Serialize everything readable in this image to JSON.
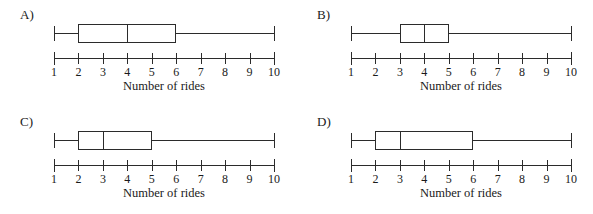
{
  "figure": {
    "background_color": "#ffffff",
    "ink_color": "#2b2b2b"
  },
  "axis": {
    "caption": "Number of rides",
    "tick_labels": [
      "1",
      "2",
      "3",
      "4",
      "5",
      "6",
      "7",
      "8",
      "9",
      "10"
    ],
    "min": 1,
    "max": 10
  },
  "panels": [
    {
      "letter": "A)",
      "name": "option-a",
      "whisker_min": 1,
      "q1": 2,
      "median": 4,
      "q3": 6,
      "whisker_max": 10
    },
    {
      "letter": "B)",
      "name": "option-b",
      "whisker_min": 1,
      "q1": 3,
      "median": 4,
      "q3": 5,
      "whisker_max": 10
    },
    {
      "letter": "C)",
      "name": "option-c",
      "whisker_min": 1,
      "q1": 2,
      "median": 3,
      "q3": 5,
      "whisker_max": 10
    },
    {
      "letter": "D)",
      "name": "option-d",
      "whisker_min": 1,
      "q1": 2,
      "median": 3,
      "q3": 6,
      "whisker_max": 10
    }
  ],
  "chart_data": {
    "type": "box",
    "title": "",
    "xlabel": "Number of rides",
    "ylabel": "",
    "xlim": [
      1,
      10
    ],
    "xticks": [
      1,
      2,
      3,
      4,
      5,
      6,
      7,
      8,
      9,
      10
    ],
    "grid": false,
    "legend": "none",
    "orientation": "horizontal",
    "panel_layout": "2x2",
    "series": [
      {
        "name": "A)",
        "whisker_min": 1,
        "q1": 2,
        "median": 4,
        "q3": 6,
        "whisker_max": 10
      },
      {
        "name": "B)",
        "whisker_min": 1,
        "q1": 3,
        "median": 4,
        "q3": 5,
        "whisker_max": 10
      },
      {
        "name": "C)",
        "whisker_min": 1,
        "q1": 2,
        "median": 3,
        "q3": 5,
        "whisker_max": 10
      },
      {
        "name": "D)",
        "whisker_min": 1,
        "q1": 2,
        "median": 3,
        "q3": 6,
        "whisker_max": 10
      }
    ]
  }
}
